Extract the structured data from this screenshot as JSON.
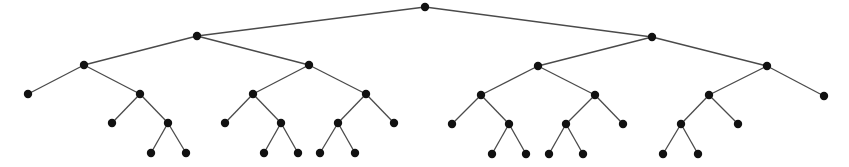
{
  "diagram": {
    "type": "tree",
    "title": "",
    "colors": {
      "edge": "#4a4a4a",
      "node": "#111111",
      "background": "#ffffff"
    },
    "node_radius": 4.2,
    "nodes": [
      {
        "id": "r",
        "x": 425,
        "y": 7
      },
      {
        "id": "a",
        "x": 197,
        "y": 36
      },
      {
        "id": "b",
        "x": 652,
        "y": 37
      },
      {
        "id": "a1",
        "x": 84,
        "y": 65
      },
      {
        "id": "a2",
        "x": 309,
        "y": 65
      },
      {
        "id": "b1",
        "x": 538,
        "y": 66
      },
      {
        "id": "b2",
        "x": 767,
        "y": 66
      },
      {
        "id": "a1l",
        "x": 28,
        "y": 94
      },
      {
        "id": "a1r",
        "x": 140,
        "y": 94
      },
      {
        "id": "a2l",
        "x": 253,
        "y": 94
      },
      {
        "id": "a2r",
        "x": 366,
        "y": 94
      },
      {
        "id": "b1l",
        "x": 481,
        "y": 95
      },
      {
        "id": "b1r",
        "x": 595,
        "y": 95
      },
      {
        "id": "b2l",
        "x": 709,
        "y": 95
      },
      {
        "id": "b2r",
        "x": 824,
        "y": 96
      },
      {
        "id": "a1rl",
        "x": 112,
        "y": 123
      },
      {
        "id": "a1rr",
        "x": 168,
        "y": 123
      },
      {
        "id": "a2ll",
        "x": 225,
        "y": 123
      },
      {
        "id": "a2lr",
        "x": 281,
        "y": 123
      },
      {
        "id": "a2rl",
        "x": 338,
        "y": 123
      },
      {
        "id": "a2rr",
        "x": 394,
        "y": 123
      },
      {
        "id": "b1ll",
        "x": 452,
        "y": 124
      },
      {
        "id": "b1lr",
        "x": 509,
        "y": 124
      },
      {
        "id": "b1rl",
        "x": 566,
        "y": 124
      },
      {
        "id": "b1rr",
        "x": 623,
        "y": 124
      },
      {
        "id": "b2ll",
        "x": 681,
        "y": 124
      },
      {
        "id": "b2lr",
        "x": 738,
        "y": 124
      },
      {
        "id": "a1rrl",
        "x": 151,
        "y": 153
      },
      {
        "id": "a1rrr",
        "x": 186,
        "y": 153
      },
      {
        "id": "a2lrl",
        "x": 264,
        "y": 153
      },
      {
        "id": "a2lrr",
        "x": 298,
        "y": 153
      },
      {
        "id": "a2rll",
        "x": 320,
        "y": 153
      },
      {
        "id": "a2rlr",
        "x": 355,
        "y": 153
      },
      {
        "id": "b1lrl",
        "x": 492,
        "y": 154
      },
      {
        "id": "b1lrr",
        "x": 526,
        "y": 154
      },
      {
        "id": "b1rll",
        "x": 549,
        "y": 154
      },
      {
        "id": "b1rlr",
        "x": 583,
        "y": 154
      },
      {
        "id": "b2lll",
        "x": 663,
        "y": 154
      },
      {
        "id": "b2llr",
        "x": 698,
        "y": 154
      }
    ],
    "edges": [
      [
        "r",
        "a"
      ],
      [
        "r",
        "b"
      ],
      [
        "a",
        "a1"
      ],
      [
        "a",
        "a2"
      ],
      [
        "b",
        "b1"
      ],
      [
        "b",
        "b2"
      ],
      [
        "a1",
        "a1l"
      ],
      [
        "a1",
        "a1r"
      ],
      [
        "a2",
        "a2l"
      ],
      [
        "a2",
        "a2r"
      ],
      [
        "b1",
        "b1l"
      ],
      [
        "b1",
        "b1r"
      ],
      [
        "b2",
        "b2l"
      ],
      [
        "b2",
        "b2r"
      ],
      [
        "a1r",
        "a1rl"
      ],
      [
        "a1r",
        "a1rr"
      ],
      [
        "a2l",
        "a2ll"
      ],
      [
        "a2l",
        "a2lr"
      ],
      [
        "a2r",
        "a2rl"
      ],
      [
        "a2r",
        "a2rr"
      ],
      [
        "b1l",
        "b1ll"
      ],
      [
        "b1l",
        "b1lr"
      ],
      [
        "b1r",
        "b1rl"
      ],
      [
        "b1r",
        "b1rr"
      ],
      [
        "b2l",
        "b2ll"
      ],
      [
        "b2l",
        "b2lr"
      ],
      [
        "a1rr",
        "a1rrl"
      ],
      [
        "a1rr",
        "a1rrr"
      ],
      [
        "a2lr",
        "a2lrl"
      ],
      [
        "a2lr",
        "a2lrr"
      ],
      [
        "a2rl",
        "a2rll"
      ],
      [
        "a2rl",
        "a2rlr"
      ],
      [
        "b1lr",
        "b1lrl"
      ],
      [
        "b1lr",
        "b1lrr"
      ],
      [
        "b1rl",
        "b1rll"
      ],
      [
        "b1rl",
        "b1rlr"
      ],
      [
        "b2ll",
        "b2lll"
      ],
      [
        "b2ll",
        "b2llr"
      ]
    ]
  }
}
